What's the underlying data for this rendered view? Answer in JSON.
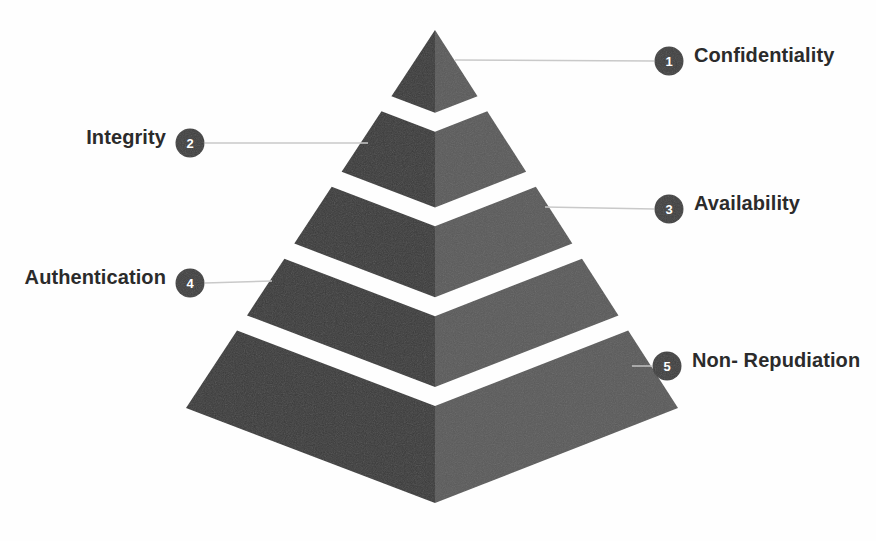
{
  "diagram": {
    "type": "pyramid",
    "title": "",
    "tier_count": 5,
    "colors": {
      "face_left": "#3a3a3a",
      "face_right": "#5a5a5a",
      "badge_fill": "#3f3f3f",
      "badge_text": "#ffffff",
      "connector": "#c9c9c9",
      "label_text": "#2b2b2b",
      "background": "#fefefe"
    },
    "tiers": [
      {
        "number": "1",
        "label": "Confidentiality",
        "side": "right",
        "badge_cx": 669,
        "badge_cy": 61,
        "label_x": 694,
        "label_y": 44,
        "connector_x1": 455,
        "connector_y1": 60,
        "connector_x2": 654,
        "connector_y2": 61
      },
      {
        "number": "2",
        "label": "Integrity",
        "side": "left",
        "badge_cx": 190,
        "badge_cy": 143,
        "label_x": 166,
        "label_y": 126,
        "connector_x1": 205,
        "connector_y1": 143,
        "connector_x2": 368,
        "connector_y2": 143
      },
      {
        "number": "3",
        "label": "Availability",
        "side": "right",
        "badge_cx": 669,
        "badge_cy": 209,
        "label_x": 694,
        "label_y": 192,
        "connector_x1": 545,
        "connector_y1": 207,
        "connector_x2": 654,
        "connector_y2": 209
      },
      {
        "number": "4",
        "label": "Authentication",
        "side": "left",
        "badge_cx": 190,
        "badge_cy": 283,
        "label_x": 166,
        "label_y": 266,
        "connector_x1": 205,
        "connector_y1": 283,
        "connector_x2": 272,
        "connector_y2": 281
      },
      {
        "number": "5",
        "label": "Non- Repudiation",
        "side": "right",
        "badge_cx": 667,
        "badge_cy": 366,
        "label_x": 692,
        "label_y": 349,
        "connector_x1": 632,
        "connector_y1": 366,
        "connector_x2": 652,
        "connector_y2": 366
      }
    ],
    "geometry": {
      "apex_x": 435,
      "apex_y": 30,
      "base_left_x": 186,
      "base_right_x": 678,
      "base_corner_y": 408,
      "front_bottom_y": 503,
      "center_x": 435
    }
  }
}
